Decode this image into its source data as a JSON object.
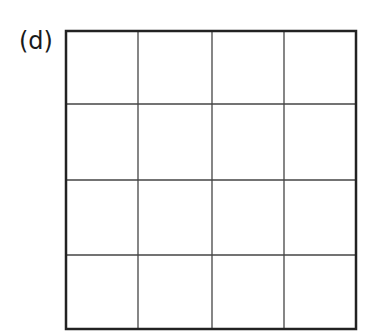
{
  "figure": {
    "label": "(d)",
    "grid": {
      "rows": 4,
      "cols": 4,
      "frame": {
        "x": 66,
        "y": 31,
        "width": 290,
        "height": 298
      },
      "vertical_lines_x": [
        138,
        212,
        284
      ],
      "horizontal_lines_y": [
        104,
        180,
        255
      ],
      "border_color": "#222222",
      "line_color": "#444444",
      "border_width": 2.5,
      "line_width": 1.3,
      "fill": "#ffffff"
    }
  }
}
